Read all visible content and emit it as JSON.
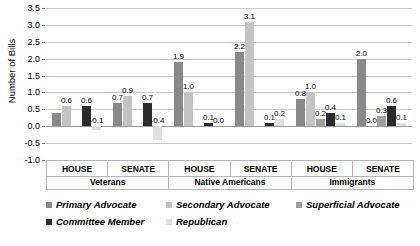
{
  "chart_data": {
    "type": "bar",
    "title": "",
    "xlabel": "",
    "ylabel": "Number of Bills",
    "ylim": [
      -1.0,
      3.5
    ],
    "ytick_labels": [
      "3.5",
      "3.0",
      "2.5",
      "2.0",
      "1.5",
      "1.0",
      "0.5",
      "0.0",
      "-0.5",
      "-1.0"
    ],
    "ytick_values": [
      3.5,
      3.0,
      2.5,
      2.0,
      1.5,
      1.0,
      0.5,
      0.0,
      -0.5,
      -1.0
    ],
    "grid": true,
    "legend_position": "bottom",
    "group_labels": [
      "Veterans",
      "Native Americans",
      "Immigrants"
    ],
    "subgroup_labels": [
      "HOUSE",
      "SENATE"
    ],
    "categories": [
      "Veterans HOUSE",
      "Veterans SENATE",
      "Native Americans HOUSE",
      "Native Americans SENATE",
      "Immigrants HOUSE",
      "Immigrants SENATE"
    ],
    "series": [
      {
        "name": "Primary Advocate",
        "color": "#898989",
        "values": [
          0.4,
          0.7,
          1.9,
          2.2,
          0.8,
          2.0
        ],
        "labels": [
          "",
          "0.7",
          "1.9",
          "2.2",
          "0.8",
          "2.0"
        ]
      },
      {
        "name": "Secondary Advocate",
        "color": "#c4c4c4",
        "values": [
          0.6,
          0.9,
          1.0,
          3.1,
          1.0,
          0.0
        ],
        "labels": [
          "0.6",
          "0.9",
          "1.0",
          "3.1",
          "1.0",
          "0.0"
        ]
      },
      {
        "name": "Superficial Advocate",
        "color": "#a0a0a0",
        "values": [
          0.0,
          0.0,
          0.0,
          0.0,
          0.2,
          0.3
        ],
        "labels": [
          "",
          "",
          "",
          "",
          "0.2",
          "0.3"
        ]
      },
      {
        "name": "Committee Member",
        "color": "#2b2b2b",
        "values": [
          0.6,
          0.7,
          0.1,
          0.1,
          0.4,
          0.6
        ],
        "labels": [
          "0.6",
          "0.7",
          "0.1",
          "0.1",
          "0.4",
          "0.6"
        ]
      },
      {
        "name": "Republican",
        "color": "#e0e0e0",
        "values": [
          -0.1,
          -0.4,
          0.0,
          0.2,
          0.1,
          0.1
        ],
        "labels": [
          "-0.1",
          "-0.4",
          "0.0",
          "0.2",
          "0.1",
          "0.1"
        ]
      }
    ]
  },
  "legend": {
    "row1": [
      {
        "label": "Primary Advocate",
        "color": "#898989"
      },
      {
        "label": "Secondary Advocate",
        "color": "#c4c4c4"
      },
      {
        "label": "Superficial Advocate",
        "color": "#a0a0a0"
      }
    ],
    "row2": [
      {
        "label": "Committee Member",
        "color": "#2b2b2b"
      },
      {
        "label": "Republican",
        "color": "#e0e0e0"
      }
    ]
  }
}
